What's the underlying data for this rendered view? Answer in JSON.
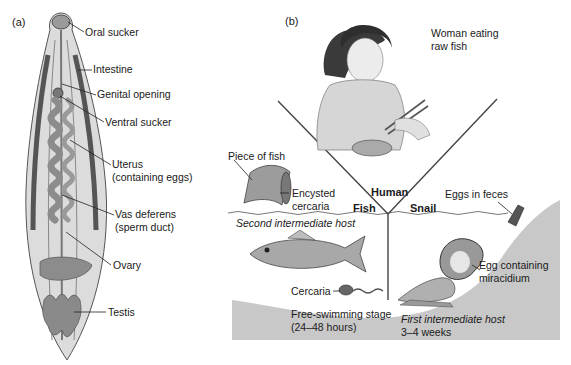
{
  "figure": {
    "panel_a": {
      "tag": "(a)",
      "labels": {
        "oral_sucker": "Oral sucker",
        "intestine": "Intestine",
        "genital_opening": "Genital opening",
        "ventral_sucker": "Ventral sucker",
        "uterus_1": "Uterus",
        "uterus_2": "(containing eggs)",
        "vas_deferens_1": "Vas deferens",
        "vas_deferens_2": "(sperm duct)",
        "ovary": "Ovary",
        "testis": "Testis"
      }
    },
    "panel_b": {
      "tag": "(b)",
      "labels": {
        "woman_1": "Woman eating",
        "woman_2": "raw fish",
        "piece_of_fish": "Piece of fish",
        "encysted_1": "Encysted",
        "encysted_2": "cercaria",
        "human": "Human",
        "fish": "Fish",
        "snail": "Snail",
        "eggs_in_feces": "Eggs in feces",
        "second_host": "Second intermediate host",
        "egg_containing_1": "Egg containing",
        "egg_containing_2": "miracidium",
        "cercaria": "Cercaria",
        "free_swimming_1": "Free-swimming stage",
        "free_swimming_2": "(24–48 hours)",
        "first_host_1": "First intermediate host",
        "first_host_2": "3–4 weeks"
      }
    },
    "colors": {
      "worm_body": "#d9d9d9",
      "worm_organs": "#8a8a8a",
      "ground": "#c8c8c8",
      "line": "#333333"
    }
  }
}
